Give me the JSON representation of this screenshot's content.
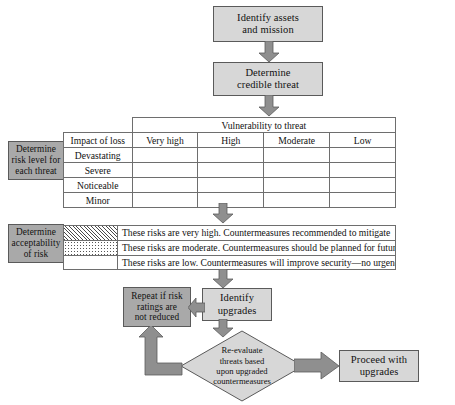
{
  "diagram": {
    "colors": {
      "box_fill": "#d7d7d7",
      "label_box_fill": "#a9a9a9",
      "arrow_fill": "#8f8f8f",
      "border": "#5a5a5a",
      "table_border": "#6e6e6e",
      "background": "#ffffff"
    },
    "nodes": {
      "identify_assets": "Identify assets and mission",
      "identify_assets_line1": "Identify assets",
      "identify_assets_line2": "and mission",
      "determine_threat_line1": "Determine",
      "determine_threat_line2": "credible threat",
      "determine_risk_level_line1": "Determine",
      "determine_risk_level_line2": "risk level for",
      "determine_risk_level_line3": "each threat",
      "acceptability_line1": "Determine",
      "acceptability_line2": "acceptability",
      "acceptability_line3": "of risk",
      "repeat_line1": "Repeat if risk",
      "repeat_line2": "ratings are",
      "repeat_line3": "not reduced",
      "identify_upgrades_line1": "Identify",
      "identify_upgrades_line2": "upgrades",
      "reevaluate_line1": "Re-evaluate",
      "reevaluate_line2": "threats based",
      "reevaluate_line3": "upon upgraded",
      "reevaluate_line4": "countermeasures",
      "proceed_line1": "Proceed with",
      "proceed_line2": "upgrades"
    },
    "matrix": {
      "super_header": "Vulnerability to threat",
      "row_header": "Impact of loss",
      "columns": [
        "Very high",
        "High",
        "Moderate",
        "Low"
      ],
      "rows": [
        "Devastating",
        "Severe",
        "Noticeable",
        "Minor"
      ],
      "cells": [
        [
          "hatch",
          "hatch",
          "dots",
          "dots"
        ],
        [
          "hatch",
          "hatch",
          "dots",
          "none"
        ],
        [
          "hatch",
          "dots",
          "none",
          "none"
        ],
        [
          "dots",
          "dots",
          "none",
          "none"
        ]
      ]
    },
    "legend": [
      {
        "pattern": "hatch",
        "text": "These risks are very high. Countermeasures recommended to mitigate"
      },
      {
        "pattern": "dots",
        "text": "These risks are moderate. Countermeasures should be planned for future"
      },
      {
        "pattern": "none",
        "text": "These risks are low. Countermeasures will improve security—no urgency"
      }
    ]
  }
}
